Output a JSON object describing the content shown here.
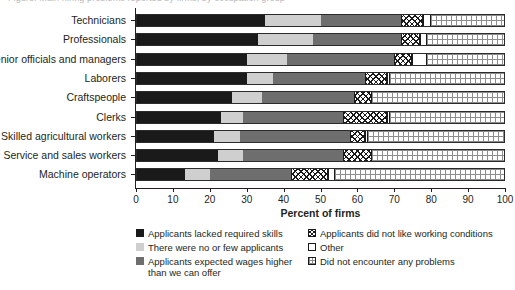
{
  "top_caption": "Figure: Main hiring problems reported by firms, by occupation group",
  "chart_data": {
    "type": "bar",
    "orientation": "horizontal",
    "stacked": true,
    "title": "",
    "xlabel": "Percent of firms",
    "ylabel": "",
    "xlim": [
      0,
      100
    ],
    "xticks": [
      0,
      10,
      20,
      30,
      40,
      50,
      60,
      70,
      80,
      90,
      100
    ],
    "grid": false,
    "legend_position": "bottom",
    "categories": [
      "Technicians",
      "Professionals",
      "Senior officials and managers",
      "Laborers",
      "Craftspeople",
      "Clerks",
      "Skilled agricultural workers",
      "Service and sales workers",
      "Machine operators"
    ],
    "series": [
      {
        "name": "Applicants lacked required skills",
        "color": "#1a1a1a",
        "pattern": "solid-black",
        "values": [
          35,
          33,
          30,
          30,
          26,
          23,
          21,
          22,
          13
        ]
      },
      {
        "name": "There were no or few applicants",
        "color": "#cfcfcf",
        "pattern": "solid-light-gray",
        "values": [
          15,
          15,
          11,
          7,
          8,
          6,
          7,
          7,
          7
        ]
      },
      {
        "name": "Applicants expected wages higher than we can offer",
        "color": "#6e6e6e",
        "pattern": "solid-mid-gray",
        "values": [
          22,
          24,
          29,
          25,
          25,
          27,
          30,
          27,
          22
        ]
      },
      {
        "name": "Applicants did not like working conditions",
        "color": "#ffffff",
        "pattern": "crosshatch",
        "values": [
          6,
          5,
          5,
          6,
          5,
          12,
          4,
          8,
          10
        ]
      },
      {
        "name": "Other",
        "color": "#ffffff",
        "pattern": "open",
        "values": [
          2,
          2,
          4,
          1,
          0,
          1,
          1,
          0,
          2
        ]
      },
      {
        "name": "Did not encounter any problems",
        "color": "#ffffff",
        "pattern": "fine-grid",
        "values": [
          20,
          21,
          21,
          31,
          36,
          31,
          37,
          36,
          46
        ]
      }
    ]
  },
  "legend": {
    "columns": [
      {
        "items": [
          "Applicants lacked required skills",
          "There were no or few applicants",
          "Applicants expected wages higher than we can offer"
        ]
      },
      {
        "items": [
          "Applicants did not like working conditions",
          "Other",
          "Did not encounter any problems"
        ]
      }
    ]
  }
}
